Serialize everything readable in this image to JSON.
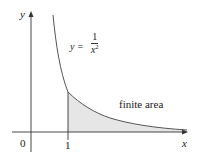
{
  "figure": {
    "type": "function graph with shaded improper-integral region",
    "axes": {
      "x_label": "x",
      "y_label": "y",
      "origin_label": "0",
      "x_tick_labels": [
        "1"
      ]
    },
    "curve": {
      "equation_lhs": "y =",
      "equation_numerator": "1",
      "equation_denominator_base": "x",
      "equation_denominator_exponent": "2"
    },
    "region": {
      "label": "finite area",
      "x_from": 1,
      "x_to": "infinity",
      "fill_color": "#e6e6e6"
    },
    "colors": {
      "axis": "#333333",
      "curve": "#555555",
      "shading": "#e6e6e6",
      "text": "#222222"
    }
  }
}
